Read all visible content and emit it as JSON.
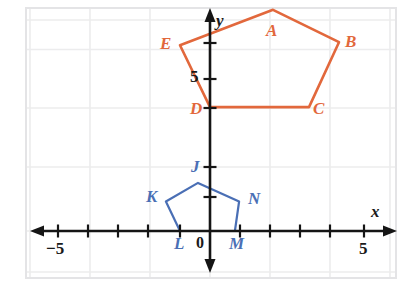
{
  "figure": {
    "background_color": "#ffffff",
    "grid_color": "#e9e9ec",
    "axis_color": "#151515",
    "width": 419,
    "height": 286
  },
  "axes": {
    "x_axis_label": "x",
    "y_axis_label": "y",
    "origin_label": "0",
    "x_ticks_labeled": [
      {
        "value": -5,
        "text": "−5"
      },
      {
        "value": 5,
        "text": "5"
      }
    ],
    "y_ticks_labeled": [
      {
        "value": 5,
        "text": "5"
      }
    ],
    "x_range": [
      -6.5,
      6.5
    ],
    "y_range": [
      -1.5,
      8.5
    ],
    "tick_spacing": 1,
    "grid": true
  },
  "chart_data": {
    "type": "scatter",
    "xlabel": "x",
    "ylabel": "y",
    "xlim": [
      -6.5,
      6.5
    ],
    "ylim": [
      -1.5,
      8.5
    ],
    "grid": true,
    "legend": "none",
    "series": [
      {
        "name": "Pentagon ABCDE",
        "color": "#e2683c",
        "closed": true,
        "points": [
          {
            "label": "A",
            "x": 2.1,
            "y": 7.5
          },
          {
            "label": "B",
            "x": 4.3,
            "y": 6.4
          },
          {
            "label": "C",
            "x": 3.3,
            "y": 4.2
          },
          {
            "label": "D",
            "x": 0.0,
            "y": 4.2
          },
          {
            "label": "E",
            "x": -1.0,
            "y": 6.3
          }
        ]
      },
      {
        "name": "Pentagon JKLMN",
        "color": "#4a6fb5",
        "closed": true,
        "points": [
          {
            "label": "J",
            "x": -0.4,
            "y": 1.63
          },
          {
            "label": "K",
            "x": -1.47,
            "y": 1.0
          },
          {
            "label": "L",
            "x": -1.0,
            "y": 0.0
          },
          {
            "label": "M",
            "x": 0.83,
            "y": 0.0
          },
          {
            "label": "N",
            "x": 0.97,
            "y": 1.0
          }
        ]
      }
    ]
  },
  "labels": {
    "red": {
      "A": "A",
      "B": "B",
      "C": "C",
      "D": "D",
      "E": "E"
    },
    "blue": {
      "J": "J",
      "K": "K",
      "L": "L",
      "M": "M",
      "N": "N"
    },
    "axis": {
      "x": "x",
      "y": "y",
      "origin": "0",
      "x_neg_five": "−5",
      "x_pos_five": "5",
      "y_five": "5"
    }
  }
}
